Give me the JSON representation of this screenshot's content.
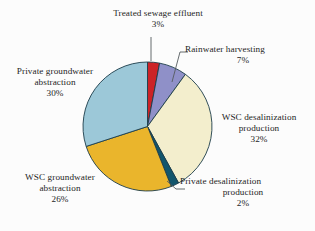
{
  "chart_data": {
    "type": "pie",
    "title": "",
    "xlabel": "",
    "ylabel": "",
    "unit": "%",
    "legend_position": "none",
    "grid": false,
    "start_angle_deg": 0,
    "direction": "clockwise",
    "categories": [
      "Treated sewage effluent",
      "Rainwater harvesting",
      "WSC desalinization production",
      "Private desalinization production",
      "WSC groundwater abstraction",
      "Private groundwater abstraction"
    ],
    "values": [
      3,
      7,
      32,
      2,
      26,
      30
    ],
    "colors": [
      "#cc2327",
      "#8f90c8",
      "#f3eecd",
      "#12566d",
      "#eab52c",
      "#9cc8d8"
    ],
    "slice_outline_color": "#1c3c4a",
    "background_color": "#fcfcfc",
    "text_color": "#1f1f1f",
    "slices": [
      {
        "label": "Treated sewage effluent",
        "value": 3,
        "display_value": "3%",
        "color": "#cc2327"
      },
      {
        "label": "Rainwater harvesting",
        "value": 7,
        "display_value": "7%",
        "color": "#8f90c8"
      },
      {
        "label": "WSC desalinization production",
        "value": 32,
        "display_value": "32%",
        "color": "#f3eecd"
      },
      {
        "label": "Private desalinization production",
        "value": 2,
        "display_value": "2%",
        "color": "#12566d"
      },
      {
        "label": "WSC groundwater abstraction",
        "value": 26,
        "display_value": "26%",
        "color": "#eab52c"
      },
      {
        "label": "Private groundwater abstraction",
        "value": 30,
        "display_value": "30%",
        "color": "#9cc8d8"
      }
    ]
  },
  "labels": {
    "treated_sewage": {
      "line1": "Treated sewage effluent",
      "pct": "3%"
    },
    "rainwater": {
      "line1": "Rainwater harvesting",
      "pct": "7%"
    },
    "wsc_desal": {
      "line1": "WSC desalinization",
      "line2": "production",
      "pct": "32%"
    },
    "private_desal": {
      "line1": "Private desalinization",
      "line2": "production",
      "pct": "2%"
    },
    "wsc_ground": {
      "line1": "WSC groundwater",
      "line2": "abstraction",
      "pct": "26%"
    },
    "private_ground": {
      "line1": "Private groundwater",
      "line2": "abstraction",
      "pct": "30%"
    }
  }
}
